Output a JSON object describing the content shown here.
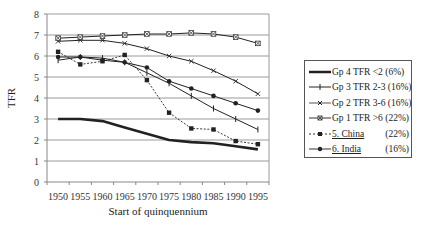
{
  "chart_data": {
    "type": "line",
    "title": "",
    "xlabel": "Start of quinquennium",
    "ylabel": "TFR",
    "ylim": [
      0,
      8
    ],
    "yticks": [
      0,
      1,
      2,
      3,
      4,
      5,
      6,
      7,
      8
    ],
    "grid": true,
    "legend_position": "right",
    "x": [
      "1950",
      "1955",
      "1960",
      "1965",
      "1970",
      "1975",
      "1980",
      "1985",
      "1990",
      "1995"
    ],
    "series": [
      {
        "name": "Gp 4 TFR <2",
        "share": "(6%)",
        "style": "thick-solid",
        "marker": "none",
        "values": [
          3.0,
          3.0,
          2.9,
          2.6,
          2.3,
          2.0,
          1.9,
          1.85,
          1.7,
          1.55
        ]
      },
      {
        "name": "Gp 3 TFR 2-3",
        "share": "(16%)",
        "style": "solid",
        "marker": "plus",
        "values": [
          5.8,
          5.95,
          5.9,
          5.7,
          5.2,
          4.7,
          4.1,
          3.5,
          3.0,
          2.5
        ]
      },
      {
        "name": "Gp 2 TFR 3-6",
        "share": "(16%)",
        "style": "solid",
        "marker": "x",
        "values": [
          6.7,
          6.75,
          6.75,
          6.6,
          6.35,
          6.0,
          5.75,
          5.3,
          4.8,
          4.2
        ]
      },
      {
        "name": "Gp 1 TFR >6",
        "share": "(22%)",
        "style": "solid",
        "marker": "x-box",
        "values": [
          6.85,
          6.9,
          6.95,
          7.0,
          7.05,
          7.05,
          7.1,
          7.05,
          6.9,
          6.6
        ]
      },
      {
        "name": "5. China",
        "share": "(22%)",
        "style": "dashed",
        "marker": "square",
        "values": [
          6.2,
          5.6,
          5.75,
          6.05,
          4.85,
          3.3,
          2.55,
          2.5,
          1.95,
          1.8
        ]
      },
      {
        "name": "6. India",
        "share": "(16%)",
        "style": "solid",
        "marker": "circle",
        "values": [
          5.95,
          5.95,
          5.8,
          5.7,
          5.45,
          4.8,
          4.45,
          4.1,
          3.75,
          3.4
        ]
      }
    ]
  },
  "legend": {
    "items": [
      {
        "label": "Gp 4 TFR <2 (6%)",
        "pct": ""
      },
      {
        "label": "Gp 3 TFR 2-3 (16%)",
        "pct": ""
      },
      {
        "label": "Gp 2 TFR 3-6 (16%)",
        "pct": ""
      },
      {
        "label": "Gp 1 TFR >6 (22%)",
        "pct": ""
      },
      {
        "label": "5. China",
        "pct": "(22%)"
      },
      {
        "label": "6. India",
        "pct": "(16%)"
      }
    ]
  },
  "colors": {
    "line": "#222222",
    "grid": "#9a9a9a",
    "axis": "#888888"
  }
}
